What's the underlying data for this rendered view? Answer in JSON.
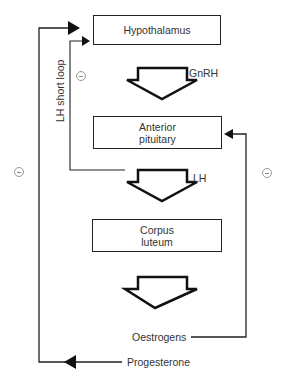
{
  "diagram": {
    "nodes": [
      {
        "id": "hypothalamus",
        "label": "Hypothalamus"
      },
      {
        "id": "anterior_pituitary",
        "label": "Anterior\npituitary"
      },
      {
        "id": "corpus_luteum",
        "label": "Corpus\nluteum"
      }
    ],
    "arrow_labels": {
      "gnrh": "GnRH",
      "lh": "LH"
    },
    "feedback": {
      "short_loop_label": "LH short loop",
      "oestrogens": "Oestrogens",
      "progesterone": "Progesterone",
      "inhibit_symbol": "−"
    },
    "colors": {
      "line": "#222222",
      "text": "#333333",
      "minus_circle": "#999999"
    }
  }
}
